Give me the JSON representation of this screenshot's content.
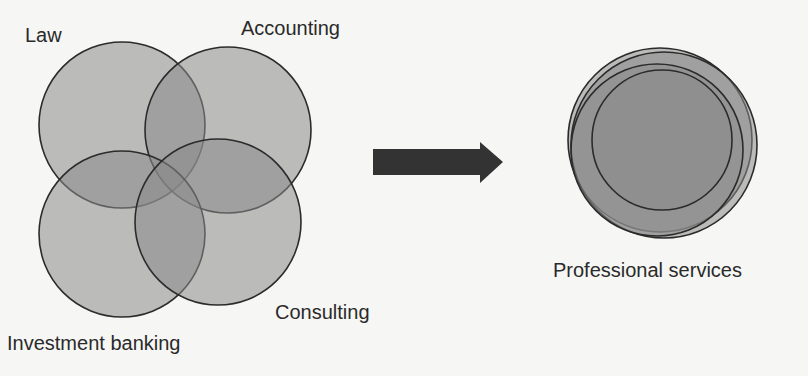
{
  "diagram": {
    "left_group": {
      "description": "Four overlapping circles, each a separate industry",
      "circles": [
        {
          "label": "Law"
        },
        {
          "label": "Accounting"
        },
        {
          "label": "Investment banking"
        },
        {
          "label": "Consulting"
        }
      ]
    },
    "arrow": {
      "direction": "right",
      "color": "#333333"
    },
    "right_group": {
      "description": "Four nearly coincident circles merged into one",
      "label": "Professional services"
    },
    "colors": {
      "background": "#f6f6f4",
      "circle_fill": "#8a8a8a",
      "circle_stroke": "#2b2b2b",
      "text": "#2a2a2a"
    }
  }
}
